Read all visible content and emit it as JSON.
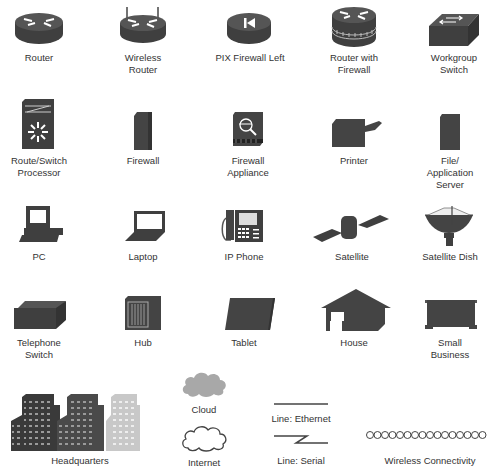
{
  "colors": {
    "icon_dark": "#4a4a4a",
    "icon_light": "#bdbdbd",
    "label": "#333333",
    "background": "#ffffff"
  },
  "rows": [
    {
      "items": [
        {
          "id": "router",
          "label": "Router",
          "icon": "router-icon"
        },
        {
          "id": "wireless-router",
          "label": "Wireless\nRouter",
          "icon": "wireless-router-icon"
        },
        {
          "id": "pix-firewall-left",
          "label": "PIX Firewall Left",
          "icon": "pix-firewall-icon"
        },
        {
          "id": "router-with-firewall",
          "label": "Router with\nFirewall",
          "icon": "router-firewall-icon"
        },
        {
          "id": "workgroup-switch",
          "label": "Workgroup\nSwitch",
          "icon": "workgroup-switch-icon"
        }
      ]
    },
    {
      "items": [
        {
          "id": "route-switch-processor",
          "label": "Route/Switch\nProcessor",
          "icon": "route-switch-processor-icon"
        },
        {
          "id": "firewall",
          "label": "Firewall",
          "icon": "firewall-icon"
        },
        {
          "id": "firewall-appliance",
          "label": "Firewall\nAppliance",
          "icon": "firewall-appliance-icon"
        },
        {
          "id": "printer",
          "label": "Printer",
          "icon": "printer-icon"
        },
        {
          "id": "file-application-server",
          "label": "File/\nApplication\nServer",
          "icon": "server-icon"
        }
      ]
    },
    {
      "items": [
        {
          "id": "pc",
          "label": "PC",
          "icon": "pc-icon"
        },
        {
          "id": "laptop",
          "label": "Laptop",
          "icon": "laptop-icon"
        },
        {
          "id": "ip-phone",
          "label": "IP Phone",
          "icon": "ip-phone-icon"
        },
        {
          "id": "satellite",
          "label": "Satellite",
          "icon": "satellite-icon"
        },
        {
          "id": "satellite-dish",
          "label": "Satellite Dish",
          "icon": "satellite-dish-icon"
        }
      ]
    },
    {
      "items": [
        {
          "id": "telephone-switch",
          "label": "Telephone\nSwitch",
          "icon": "telephone-switch-icon"
        },
        {
          "id": "hub",
          "label": "Hub",
          "icon": "hub-icon"
        },
        {
          "id": "tablet",
          "label": "Tablet",
          "icon": "tablet-icon"
        },
        {
          "id": "house",
          "label": "House",
          "icon": "house-icon"
        },
        {
          "id": "small-business",
          "label": "Small\nBusiness",
          "icon": "small-business-icon"
        }
      ]
    },
    {
      "items": [
        {
          "id": "headquarters",
          "label": "Headquarters",
          "icon": "headquarters-icon"
        },
        {
          "id": "cloud",
          "label": "Cloud",
          "icon": "cloud-icon"
        },
        {
          "id": "internet",
          "label": "Internet",
          "icon": "internet-icon"
        },
        {
          "id": "line-ethernet",
          "label": "Line: Ethernet",
          "icon": "ethernet-line-icon"
        },
        {
          "id": "line-serial",
          "label": "Line: Serial",
          "icon": "serial-line-icon"
        },
        {
          "id": "wireless-connectivity",
          "label": "Wireless Connectivity",
          "icon": "wireless-connectivity-icon"
        }
      ]
    }
  ]
}
